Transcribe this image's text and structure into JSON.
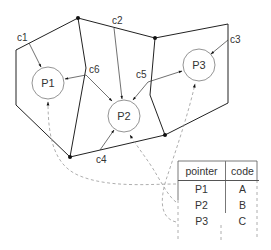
{
  "diagram": {
    "type": "spatial-partition-pointer-diagram",
    "cells": [
      {
        "id": "c1",
        "label": "c1",
        "points_to": "P1"
      },
      {
        "id": "c2",
        "label": "c2",
        "points_to": "P2"
      },
      {
        "id": "c3",
        "label": "c3",
        "points_to": "P3"
      },
      {
        "id": "c4",
        "label": "c4",
        "points_to": "P2"
      },
      {
        "id": "c5",
        "label": "c5",
        "points_to": [
          "P2",
          "P3"
        ]
      },
      {
        "id": "c6",
        "label": "c6",
        "points_to": [
          "P1",
          "P2"
        ]
      }
    ],
    "nodes": [
      {
        "id": "P1",
        "label": "P1"
      },
      {
        "id": "P2",
        "label": "P2"
      },
      {
        "id": "P3",
        "label": "P3"
      }
    ],
    "table": {
      "headers": [
        "pointer",
        "code"
      ],
      "rows": [
        {
          "pointer": "P1",
          "code": "A"
        },
        {
          "pointer": "P2",
          "code": "B"
        },
        {
          "pointer": "P3",
          "code": "C"
        }
      ]
    },
    "dashed_links": [
      {
        "from": "table.P1",
        "to": "P1"
      },
      {
        "from": "table.P2",
        "to": "P2"
      },
      {
        "from": "table.P3",
        "to": "P3"
      }
    ],
    "colors": {
      "edge": "#222222",
      "circle": "#888888",
      "dashed": "#999999",
      "text": "#333333"
    }
  }
}
